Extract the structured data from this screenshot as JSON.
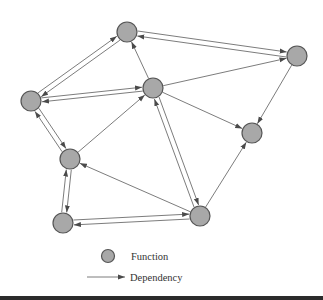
{
  "diagram": {
    "colors": {
      "node_fill": "#a8a8a8",
      "node_stroke": "#555555",
      "edge": "#5a5a5a",
      "background": "#ffffff",
      "bottom_bar": "#2b2b2b"
    },
    "node_radius": 10,
    "nodes": [
      {
        "id": "A",
        "x": 127,
        "y": 32
      },
      {
        "id": "B",
        "x": 31,
        "y": 101
      },
      {
        "id": "C",
        "x": 153,
        "y": 88
      },
      {
        "id": "D",
        "x": 297,
        "y": 56
      },
      {
        "id": "E",
        "x": 252,
        "y": 133
      },
      {
        "id": "F",
        "x": 70,
        "y": 159
      },
      {
        "id": "G",
        "x": 63,
        "y": 223
      },
      {
        "id": "H",
        "x": 200,
        "y": 216
      }
    ],
    "edges": [
      {
        "from": "B",
        "to": "A",
        "offset": -2.5
      },
      {
        "from": "A",
        "to": "B",
        "offset": -2.5
      },
      {
        "from": "A",
        "to": "D",
        "offset": -2.5
      },
      {
        "from": "D",
        "to": "A",
        "offset": -2.5
      },
      {
        "from": "C",
        "to": "A",
        "offset": 0
      },
      {
        "from": "B",
        "to": "C",
        "offset": -2
      },
      {
        "from": "C",
        "to": "B",
        "offset": -2
      },
      {
        "from": "C",
        "to": "D",
        "offset": 0
      },
      {
        "from": "C",
        "to": "E",
        "offset": 0
      },
      {
        "from": "D",
        "to": "E",
        "offset": 0
      },
      {
        "from": "B",
        "to": "F",
        "offset": -2.5
      },
      {
        "from": "F",
        "to": "B",
        "offset": -2.5
      },
      {
        "from": "F",
        "to": "C",
        "offset": 0
      },
      {
        "from": "F",
        "to": "G",
        "offset": -2.5
      },
      {
        "from": "G",
        "to": "F",
        "offset": -2.5
      },
      {
        "from": "G",
        "to": "H",
        "offset": -2.5
      },
      {
        "from": "H",
        "to": "G",
        "offset": -2.5
      },
      {
        "from": "H",
        "to": "F",
        "offset": 0
      },
      {
        "from": "C",
        "to": "H",
        "offset": -2.5
      },
      {
        "from": "H",
        "to": "C",
        "offset": -2.5
      },
      {
        "from": "H",
        "to": "E",
        "offset": 0
      }
    ]
  },
  "legend": {
    "function_label": "Function",
    "dependency_label": "Dependency"
  }
}
